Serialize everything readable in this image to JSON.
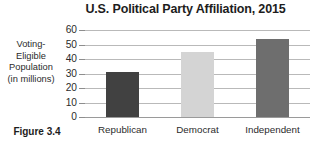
{
  "figure": {
    "caption": "Figure 3.4"
  },
  "chart_data": {
    "type": "bar",
    "title": "U.S. Political Party Affiliation, 2015",
    "xlabel": "",
    "ylabel": "Voting-Eligible Population (in millions)",
    "ylabel_lines": [
      "Voting-",
      "Eligible",
      "Population",
      "(in millions)"
    ],
    "categories": [
      "Republican",
      "Democrat",
      "Independent"
    ],
    "values": [
      31,
      45,
      54
    ],
    "bar_colors": [
      "#414141",
      "#d4d4d4",
      "#6e6e6e"
    ],
    "ylim": [
      0,
      60
    ],
    "ytick_labels": [
      "60",
      "50",
      "40",
      "30",
      "20",
      "10",
      "0"
    ],
    "ytick_values": [
      60,
      50,
      40,
      30,
      20,
      10,
      0
    ],
    "grid": true,
    "grid_color": "#b9b9b9",
    "legend": null,
    "background": "#ffffff"
  }
}
